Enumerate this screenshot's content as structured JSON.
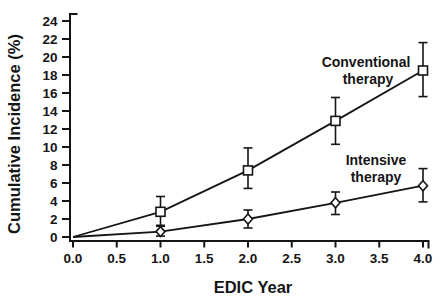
{
  "figure": {
    "background": "#ffffff",
    "ink": "#151515"
  },
  "chart_data": {
    "type": "line",
    "title": "",
    "xlabel": "EDIC Year",
    "ylabel": "Cumulative Incidence (%)",
    "xlim": [
      0.0,
      4.0
    ],
    "ylim": [
      0,
      24
    ],
    "x_ticks": [
      "0.0",
      "0.5",
      "1.0",
      "1.5",
      "2.0",
      "2.5",
      "3.0",
      "3.5",
      "4.0"
    ],
    "y_ticks": [
      "0",
      "2",
      "4",
      "6",
      "8",
      "10",
      "12",
      "14",
      "16",
      "18",
      "20",
      "22",
      "24"
    ],
    "grid": false,
    "legend_position": "inline-annotations",
    "error_bars": "vertical-with-caps",
    "series": [
      {
        "name": "Conventional therapy",
        "marker": "open-square",
        "color": "#151515",
        "x": [
          0,
          1,
          2,
          3,
          4
        ],
        "y": [
          0,
          2.8,
          7.4,
          12.9,
          18.5
        ],
        "err_low": [
          null,
          1.3,
          5.4,
          10.3,
          15.6
        ],
        "err_high": [
          null,
          4.5,
          9.9,
          15.5,
          21.6
        ],
        "label_line1": "Conventional",
        "label_line2": "therapy"
      },
      {
        "name": "Intensive therapy",
        "marker": "open-diamond",
        "color": "#151515",
        "x": [
          0,
          1,
          2,
          3,
          4
        ],
        "y": [
          0,
          0.6,
          2.0,
          3.8,
          5.7
        ],
        "err_low": [
          null,
          0.1,
          1.0,
          2.5,
          3.9
        ],
        "err_high": [
          null,
          1.2,
          3.0,
          5.0,
          7.6
        ],
        "label_line1": "Intensive",
        "label_line2": "therapy"
      }
    ]
  }
}
